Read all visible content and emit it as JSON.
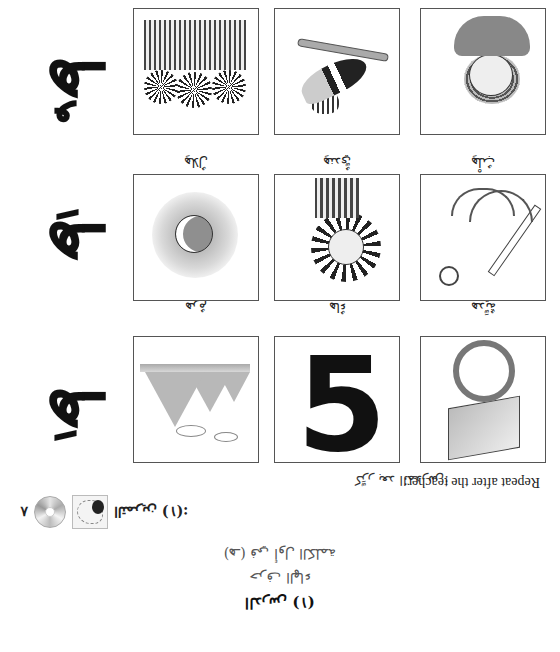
{
  "orientation": "rotated-180",
  "header": {
    "lesson_title": "الدرس (١)",
    "letter_name": "حرف الهاء",
    "letter_position": "(هـ) في أول الكلمة"
  },
  "exercise": {
    "label": "التمرين (١):",
    "thumbnail_icon": "listening-thumbnail-icon",
    "audio_icon": "cd-audio-icon",
    "track_number": "٨"
  },
  "instructions": {
    "arabic": "كرِّر بعد المدرس:",
    "english": "Repeat after the teacher:"
  },
  "rows": [
    {
      "letter": "هَـ",
      "haraka": "fatha",
      "haraka_mark": "َ",
      "items": [
        {
          "caption": "هديَّةٌ",
          "image": "gift-box-illustration"
        },
        {
          "caption": "هاءٌ",
          "image": "letter-ha-illustration"
        },
        {
          "caption": "هرمٌ",
          "image": "pyramids-illustration"
        }
      ]
    },
    {
      "letter": "هِـ",
      "haraka": "kasra",
      "haraka_mark": "ِ",
      "items": [
        {
          "caption": "هِلْبٌ",
          "image": "anchor-illustration"
        },
        {
          "caption": "هِنديٌّ",
          "image": "indian-chief-illustration"
        },
        {
          "caption": "هِلالٌ",
          "image": "crescent-moon-illustration"
        }
      ]
    },
    {
      "letter": "هُـ",
      "haraka": "damma",
      "haraka_mark": "ُ",
      "items": [
        {
          "caption": "",
          "image": "man-portrait-illustration"
        },
        {
          "caption": "",
          "image": "hoopoe-bird-illustration"
        },
        {
          "caption": "",
          "image": "indian-group-illustration"
        }
      ]
    }
  ]
}
